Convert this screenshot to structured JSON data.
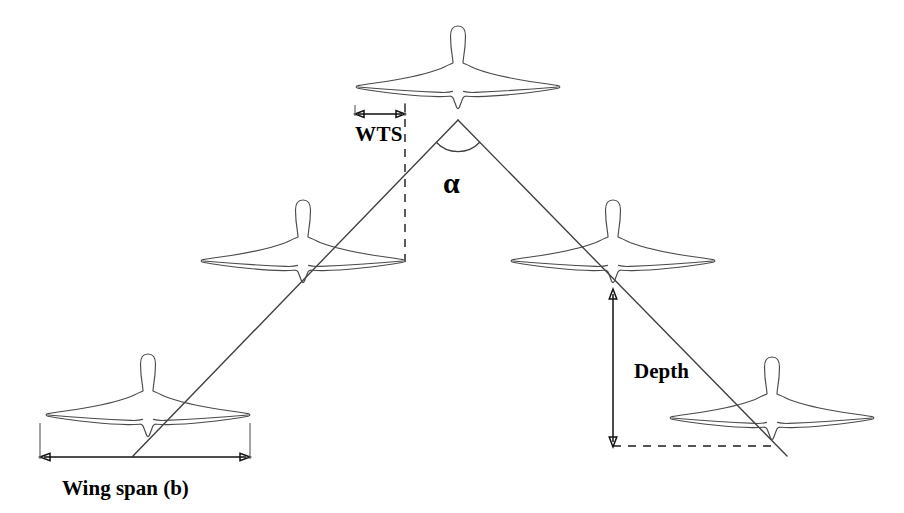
{
  "figure": {
    "background_color": "#ffffff",
    "line_color": "#4a4a4a",
    "text_color": "#000000"
  },
  "labels": {
    "wing_tip_spacing": "WTS",
    "angle": "α",
    "depth": "Depth",
    "wing_span": "Wing span (b)"
  },
  "birds": [
    {
      "id": "apex-bird",
      "position": "top-center",
      "cx": 458,
      "cy": 78,
      "span": 205
    },
    {
      "id": "left-middle-bird",
      "position": "middle-left",
      "cx": 303,
      "cy": 252,
      "span": 205
    },
    {
      "id": "right-middle-bird",
      "position": "middle-right",
      "cx": 613,
      "cy": 252,
      "span": 205
    },
    {
      "id": "left-rear-bird",
      "position": "bottom-left",
      "cx": 148,
      "cy": 405,
      "span": 205
    },
    {
      "id": "right-rear-bird",
      "position": "bottom-right",
      "cx": 772,
      "cy": 408,
      "span": 205
    }
  ],
  "measurements": {
    "wts": {
      "x_start": 355,
      "x_end": 405,
      "y": 114
    },
    "depth": {
      "x": 613,
      "y_top": 290,
      "y_bottom": 446
    },
    "wing_span": {
      "x_start": 40,
      "x_end": 250,
      "y": 457
    },
    "angle_arc": {
      "cx": 458,
      "cy": 122,
      "radius": 30
    }
  },
  "guides": {
    "vertical_dashed": {
      "x": 405,
      "y_top": 102,
      "y_bottom": 268
    },
    "horizontal_dashed": {
      "x_start": 613,
      "x_end": 775,
      "y": 446
    }
  },
  "formation_lines": {
    "left_arm": {
      "x1": 458,
      "y1": 120,
      "x2": 133,
      "y2": 455
    },
    "right_arm": {
      "x1": 458,
      "y1": 120,
      "x2": 786,
      "y2": 455
    }
  }
}
